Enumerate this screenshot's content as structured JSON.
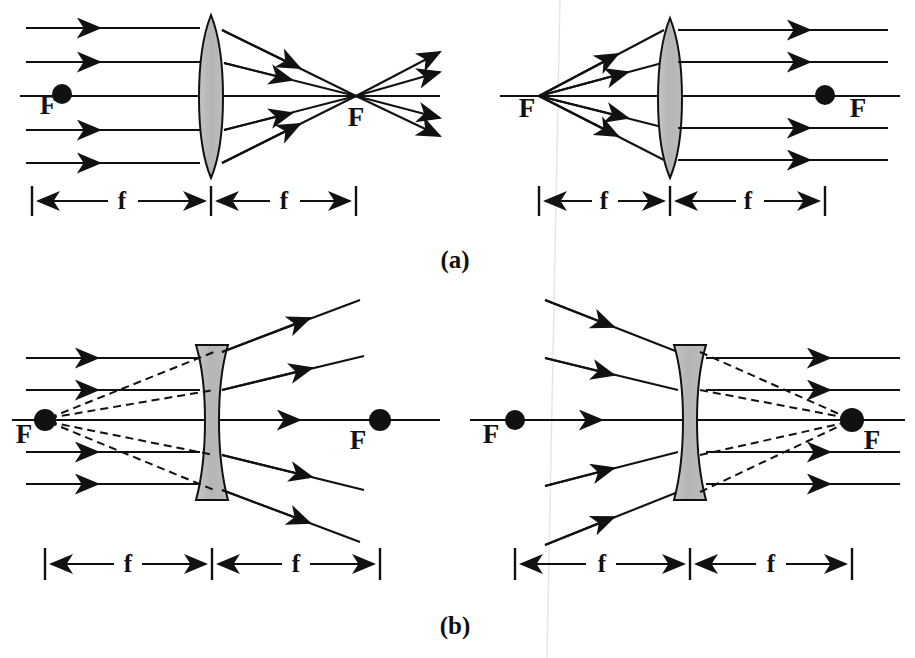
{
  "figure": {
    "background_color": "#ffffff",
    "ink_color": "#111111",
    "lens_fill_color": "#b9b9b9",
    "lens_stroke_color": "#111111",
    "part_labels": [
      {
        "id": "a",
        "text": "(a)",
        "x": 455,
        "y": 268
      },
      {
        "id": "b",
        "text": "(b)",
        "x": 455,
        "y": 634
      }
    ],
    "focal_label": "F",
    "focal_distance_label": "f",
    "panels": [
      {
        "id": "panel-a-left",
        "lens_type": "converging",
        "lens_shape": "biconvex",
        "description": "Parallel rays converge to real focal point F behind the lens",
        "axis_y": 96,
        "lens_center_x": 211,
        "focus_left_x": 62,
        "focus_right_x": 356,
        "focus_marker_side": "left",
        "ray_count": 5,
        "ray_ys": [
          28,
          62,
          96,
          130,
          163
        ],
        "dimension_y": 200,
        "dim_left_x": 32,
        "dim_mid_x": 211,
        "dim_right_x": 356,
        "f_label_left_x": 122,
        "f_label_right_x": 284
      },
      {
        "id": "panel-a-right",
        "lens_type": "converging",
        "lens_shape": "biconvex",
        "description": "Rays from focal point F emerge parallel to the axis",
        "axis_y": 96,
        "lens_center_x": 670,
        "focus_left_x": 539,
        "focus_right_x": 825,
        "focus_marker_side": "right",
        "ray_count": 5,
        "ray_ys": [
          30,
          62,
          96,
          128,
          160
        ],
        "dimension_y": 200,
        "dim_left_x": 539,
        "dim_mid_x": 670,
        "dim_right_x": 825,
        "f_label_left_x": 604,
        "f_label_right_x": 748
      },
      {
        "id": "panel-b-left",
        "lens_type": "diverging",
        "lens_shape": "biconcave",
        "description": "Parallel rays diverge; dashed extensions trace back to virtual focal point F in front of the lens",
        "axis_y": 420,
        "lens_center_x": 212,
        "focus_left_x": 45,
        "focus_right_x": 380,
        "focus_marker_side": "both",
        "ray_count": 5,
        "ray_ys": [
          358,
          390,
          420,
          452,
          484
        ],
        "dashed": true,
        "dimension_y": 563,
        "dim_left_x": 45,
        "dim_mid_x": 212,
        "dim_right_x": 380,
        "f_label_left_x": 128,
        "f_label_right_x": 296
      },
      {
        "id": "panel-b-right",
        "lens_type": "diverging",
        "lens_shape": "biconcave",
        "description": "Converging rays emerge parallel; dashed extensions meet at virtual focal point F behind the lens",
        "axis_y": 420,
        "lens_center_x": 690,
        "focus_left_x": 515,
        "focus_right_x": 852,
        "focus_marker_side": "both",
        "ray_count": 5,
        "ray_ys": [
          358,
          390,
          420,
          452,
          484
        ],
        "dashed": true,
        "dimension_y": 563,
        "dim_left_x": 515,
        "dim_mid_x": 690,
        "dim_right_x": 852,
        "f_label_left_x": 602,
        "f_label_right_x": 771
      }
    ],
    "focal_labels": [
      {
        "panel": "panel-a-left",
        "text": "F",
        "x": 48,
        "y": 114,
        "anchor": "middle"
      },
      {
        "panel": "panel-a-left",
        "text": "F",
        "x": 356,
        "y": 126,
        "anchor": "middle"
      },
      {
        "panel": "panel-a-right",
        "text": "F",
        "x": 527,
        "y": 117,
        "anchor": "middle"
      },
      {
        "panel": "panel-a-right",
        "text": "F",
        "x": 858,
        "y": 117,
        "anchor": "middle"
      },
      {
        "panel": "panel-b-left",
        "text": "F",
        "x": 24,
        "y": 443,
        "anchor": "middle"
      },
      {
        "panel": "panel-b-left",
        "text": "F",
        "x": 358,
        "y": 449,
        "anchor": "middle"
      },
      {
        "panel": "panel-b-right",
        "text": "F",
        "x": 491,
        "y": 443,
        "anchor": "middle"
      },
      {
        "panel": "panel-b-right",
        "text": "F",
        "x": 872,
        "y": 449,
        "anchor": "middle"
      }
    ],
    "dimension_labels": [
      {
        "panel": "panel-a-left",
        "text": "f",
        "x": 122,
        "y": 207
      },
      {
        "panel": "panel-a-left",
        "text": "f",
        "x": 284,
        "y": 207
      },
      {
        "panel": "panel-a-right",
        "text": "f",
        "x": 604,
        "y": 207
      },
      {
        "panel": "panel-a-right",
        "text": "f",
        "x": 748,
        "y": 207
      },
      {
        "panel": "panel-b-left",
        "text": "f",
        "x": 128,
        "y": 570
      },
      {
        "panel": "panel-b-left",
        "text": "f",
        "x": 296,
        "y": 570
      },
      {
        "panel": "panel-b-right",
        "text": "f",
        "x": 602,
        "y": 570
      },
      {
        "panel": "panel-b-right",
        "text": "f",
        "x": 771,
        "y": 570
      }
    ]
  }
}
